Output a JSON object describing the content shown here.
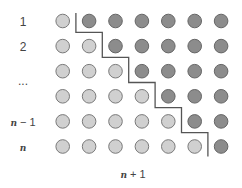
{
  "diagram": {
    "title": "",
    "row_labels": [
      {
        "text": "1",
        "italic": false
      },
      {
        "text": "2",
        "italic": false
      },
      {
        "text": "",
        "italic": false
      },
      {
        "text": "",
        "italic": false
      },
      {
        "text": "n − 1",
        "italic": true
      },
      {
        "text": "n",
        "italic": true
      }
    ],
    "ellipsis_label": "...",
    "column_label": "n + 1",
    "columns": 7,
    "rows": [
      [
        "light",
        "dark",
        "dark",
        "dark",
        "dark",
        "dark",
        "dark"
      ],
      [
        "light",
        "light",
        "dark",
        "dark",
        "dark",
        "dark",
        "dark"
      ],
      [
        "light",
        "light",
        "light",
        "dark",
        "dark",
        "dark",
        "dark"
      ],
      [
        "light",
        "light",
        "light",
        "light",
        "dark",
        "dark",
        "dark"
      ],
      [
        "light",
        "light",
        "light",
        "light",
        "light",
        "dark",
        "dark"
      ],
      [
        "light",
        "light",
        "light",
        "light",
        "light",
        "light",
        "dark"
      ]
    ],
    "colors": {
      "light_fill": "#d0d0d0",
      "light_stroke": "#7a7a7a",
      "dark_fill": "#8c8c8c",
      "dark_stroke": "#666666",
      "staircase": "#555555"
    }
  }
}
